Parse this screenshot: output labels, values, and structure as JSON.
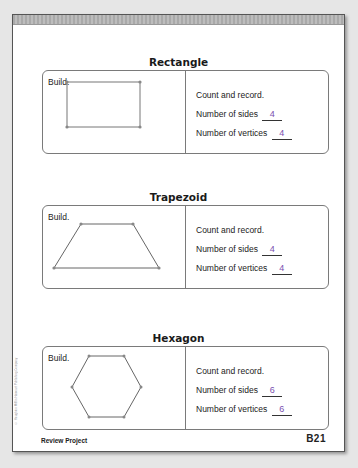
{
  "sections": [
    {
      "title": "Rectangle",
      "build_label": "Build.",
      "record_heading": "Count and record.",
      "sides_label": "Number of sides",
      "sides_value": "4",
      "vertices_label": "Number of vertices",
      "vertices_value": "4"
    },
    {
      "title": "Trapezoid",
      "build_label": "Build.",
      "record_heading": "Count and record.",
      "sides_label": "Number of sides",
      "sides_value": "4",
      "vertices_label": "Number of vertices",
      "vertices_value": "4"
    },
    {
      "title": "Hexagon",
      "build_label": "Build.",
      "record_heading": "Count and record.",
      "sides_label": "Number of sides",
      "sides_value": "6",
      "vertices_label": "Number of vertices",
      "vertices_value": "6"
    }
  ],
  "footer": {
    "left": "Review Project",
    "page_number": "B21"
  },
  "copyright": "© Houghton Mifflin Harcourt Publishing Company",
  "colors": {
    "answer": "#7a4fb0",
    "frame": "#555555",
    "card_border": "#7a7a7a"
  }
}
